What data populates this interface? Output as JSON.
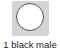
{
  "item": {
    "label": "1 black male",
    "icon": "circle-icon",
    "colors": {
      "tile": "#d4d4d4",
      "circle_fill": "#ffffff",
      "circle_stroke": "#555555"
    }
  }
}
